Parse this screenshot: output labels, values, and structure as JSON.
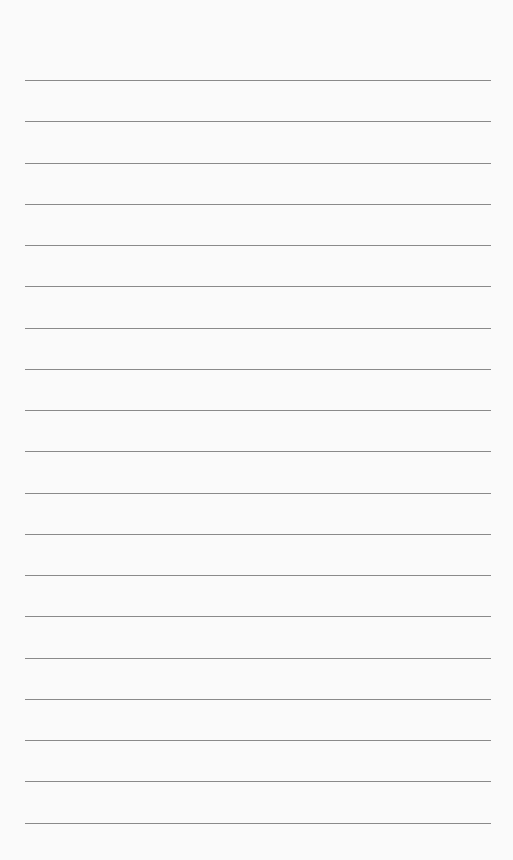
{
  "paper": {
    "line_count": 19,
    "first_line_y": 80,
    "line_spacing": 41.25,
    "line_left": 25,
    "line_width": 466,
    "line_color": "#8a8a8a",
    "background_color": "#fafafa"
  }
}
